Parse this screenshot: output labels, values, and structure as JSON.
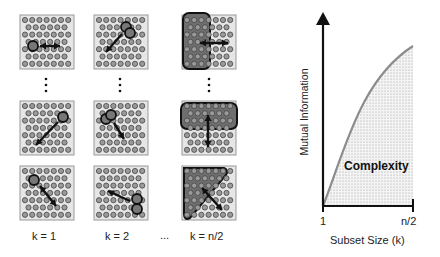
{
  "panels": {
    "column_labels": [
      "k = 1",
      "k = 2",
      "k = n/2"
    ],
    "ellipsis": "...",
    "vertical_ellipsis": "⋮",
    "grid": {
      "rows": 7,
      "cols": 7,
      "dot_color": "#9a9a9a",
      "dot_stroke": "#444444",
      "background": "#e6e6e6"
    },
    "subset_color": "#6e6e6e"
  },
  "chart_data": {
    "type": "area",
    "title": "",
    "xlabel": "Subset Size (k)",
    "ylabel": "Mutual Information",
    "x_ticks": [
      "1",
      "n/2"
    ],
    "annotation": "Complexity",
    "curve": "concave increasing saturating curve from origin to top right",
    "x": [
      0,
      0.1,
      0.2,
      0.3,
      0.4,
      0.5,
      0.6,
      0.7,
      0.8,
      0.9,
      1.0
    ],
    "values": [
      0,
      0.2,
      0.38,
      0.54,
      0.67,
      0.77,
      0.85,
      0.9,
      0.94,
      0.96,
      0.98
    ],
    "fill": "stippled gray under curve",
    "line_color": "#8c8c8c"
  },
  "chart": {
    "ylabel": "Mutual Information",
    "xlabel": "Subset Size (k)",
    "tick_start": "1",
    "tick_end": "n/2",
    "annotation": "Complexity"
  }
}
